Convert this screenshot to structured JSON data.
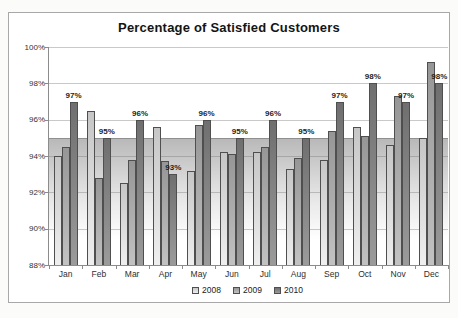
{
  "chart_data": {
    "type": "bar",
    "title": "Percentage of Satisfied Customers",
    "categories": [
      "Jan",
      "Feb",
      "Mar",
      "Apr",
      "May",
      "Jun",
      "Jul",
      "Aug",
      "Sep",
      "Oct",
      "Nov",
      "Dec"
    ],
    "series": [
      {
        "name": "2008",
        "color": "#d4d4d4",
        "values": [
          94.0,
          96.5,
          92.5,
          95.6,
          93.2,
          94.2,
          94.2,
          93.3,
          93.8,
          95.6,
          94.6,
          95.0
        ]
      },
      {
        "name": "2009",
        "color": "#a3a3a3",
        "values": [
          94.5,
          92.8,
          93.8,
          93.7,
          95.7,
          94.1,
          94.5,
          93.9,
          95.4,
          95.1,
          97.3,
          99.2
        ]
      },
      {
        "name": "2010",
        "color": "#7d7d7d",
        "values": [
          97,
          95,
          96,
          93,
          96,
          95,
          96,
          95,
          97,
          98,
          97,
          98
        ],
        "data_labels": [
          "97%",
          "95%",
          "96%",
          "93%",
          "96%",
          "95%",
          "96%",
          "95%",
          "97%",
          "98%",
          "97%",
          "98%"
        ]
      }
    ],
    "ylim": [
      88,
      100
    ],
    "y_ticks": [
      {
        "value": 100,
        "label": "100%"
      },
      {
        "value": 98,
        "label": "98%"
      },
      {
        "value": 96,
        "label": "96%"
      },
      {
        "value": 94,
        "label": "94%"
      },
      {
        "value": 92,
        "label": "92%"
      },
      {
        "value": 90,
        "label": "90%"
      },
      {
        "value": 88,
        "label": "88%"
      }
    ],
    "grid": "on",
    "highlight_band": {
      "top_value": 95,
      "fade_to_value": 89.5
    },
    "legend": {
      "position": "bottom",
      "entries": [
        "2008",
        "2009",
        "2010"
      ]
    }
  }
}
